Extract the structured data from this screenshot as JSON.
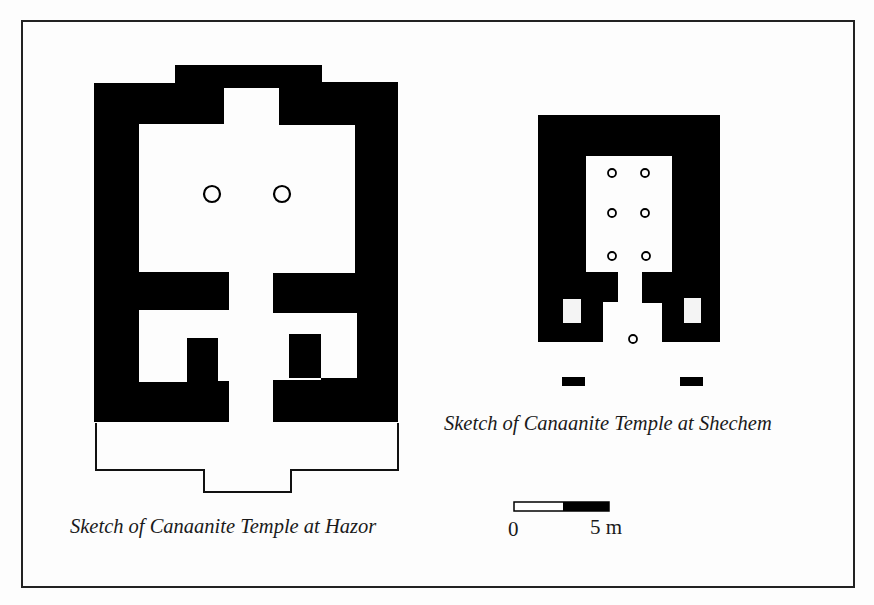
{
  "figure": {
    "colors": {
      "wall": "#000000",
      "background": "#fdfdfd",
      "frame": "#222222",
      "text": "#1a1a1a"
    }
  },
  "hazor": {
    "caption": "Sketch of Canaanite Temple at Hazor",
    "walls_path": "M94,83 L175,83 L175,65 L322,65 L322,82 L398,82 L398,422 L273,422 L273,380 L321,380 L321,334 L289,334 L289,378 L357,378 L357,313 L273,313 L273,273 L355,273 L355,125 L279,125 L279,88 L224,88 L224,124 L139,124 L139,272 L229,272 L229,310 L139,310 L139,382 L187,382 L187,338 L218,338 L218,381 L229,381 L229,422 L94,422 Z",
    "forecourt_outline": "M96,423 L96,470 L204,470 L204,492 L291,492 L291,470 L398,470 L398,423",
    "columns": [
      {
        "cx": 212,
        "cy": 194,
        "r": 8
      },
      {
        "cx": 282,
        "cy": 194,
        "r": 8
      }
    ]
  },
  "shechem": {
    "caption": "Sketch of Canaanite Temple at Shechem",
    "walls_path": "M538,115 L720,115 L720,342 L662,342 L662,303 L642,303 L642,272 L672,272 L672,156 L586,156 L586,272 L618,272 L618,302 L603,302 L603,342 L538,342 Z",
    "niches": [
      {
        "x": 563,
        "y": 299,
        "w": 18,
        "h": 24
      },
      {
        "x": 684,
        "y": 298,
        "w": 17,
        "h": 25
      }
    ],
    "columns": [
      {
        "cx": 612,
        "cy": 173,
        "r": 4
      },
      {
        "cx": 645,
        "cy": 173,
        "r": 4
      },
      {
        "cx": 612,
        "cy": 213,
        "r": 4
      },
      {
        "cx": 645,
        "cy": 213,
        "r": 4
      },
      {
        "cx": 612,
        "cy": 256,
        "r": 4
      },
      {
        "cx": 646,
        "cy": 256,
        "r": 4
      },
      {
        "cx": 633,
        "cy": 339,
        "r": 4
      }
    ],
    "gate_blocks": [
      {
        "x": 562,
        "y": 377,
        "w": 23,
        "h": 9
      },
      {
        "x": 680,
        "y": 377,
        "w": 23,
        "h": 9
      }
    ]
  },
  "scale_bar": {
    "zero_label": "0",
    "end_label": "5 m",
    "x": 514,
    "y": 502,
    "width": 95,
    "height": 9,
    "split_at": 563
  }
}
